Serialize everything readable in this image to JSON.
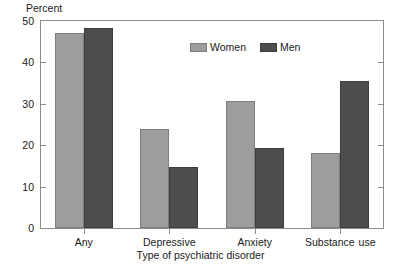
{
  "chart_data": {
    "type": "bar",
    "title": "",
    "xlabel": "Type of psychiatric disorder",
    "ylabel": "Percent",
    "categories": [
      "Any",
      "Depressive",
      "Anxiety",
      "Substance use"
    ],
    "series": [
      {
        "name": "Women",
        "color": "#9d9d9d",
        "values": [
          47.2,
          24.0,
          30.6,
          18.2
        ]
      },
      {
        "name": "Men",
        "color": "#4d4d4d",
        "values": [
          48.4,
          14.8,
          19.4,
          35.5
        ]
      }
    ],
    "ylim": [
      0,
      50
    ],
    "yticks": [
      0,
      10,
      20,
      30,
      40,
      50
    ],
    "ytick_labels": [
      "0",
      "10",
      "20",
      "30",
      "40",
      "50"
    ],
    "grid": false,
    "legend_position": "top-center"
  },
  "axes": {
    "y_title": "Percent",
    "x_title": "Type of psychiatric disorder",
    "y_ticks": [
      {
        "value": 50,
        "label": "50"
      },
      {
        "value": 40,
        "label": "40"
      },
      {
        "value": 30,
        "label": "30"
      },
      {
        "value": 20,
        "label": "20"
      },
      {
        "value": 10,
        "label": "10"
      },
      {
        "value": 0,
        "label": "0"
      }
    ],
    "x_categories": [
      {
        "label": "Any",
        "extra": ""
      },
      {
        "label": "Depressive",
        "extra": ""
      },
      {
        "label": "Anxiety",
        "extra": ""
      },
      {
        "label": "Substance",
        "extra": "use"
      }
    ]
  },
  "legend": {
    "entries": [
      {
        "label": "Women",
        "color": "#9d9d9d"
      },
      {
        "label": "Men",
        "color": "#4d4d4d"
      }
    ]
  },
  "colors": {
    "women_bar": "#9d9d9d",
    "men_bar": "#4d4d4d",
    "frame": "#8d8d8d",
    "background": "#ffffff",
    "text": "#1a1a1a"
  }
}
